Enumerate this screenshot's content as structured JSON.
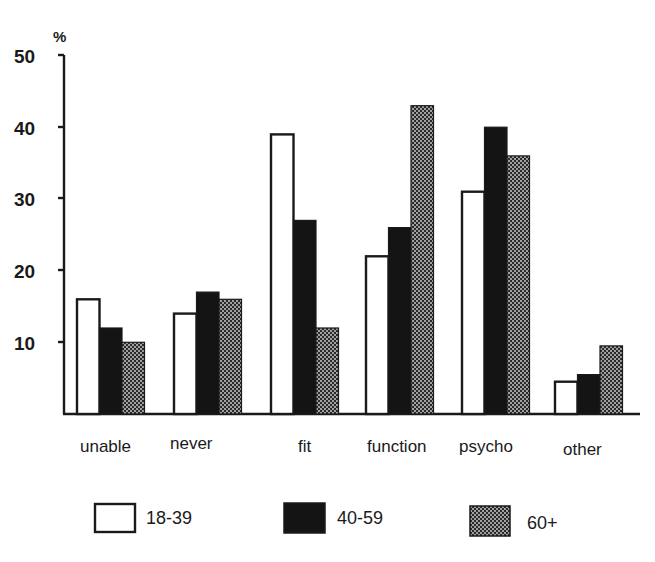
{
  "chart_data": {
    "type": "bar",
    "title": "",
    "xlabel": "",
    "ylabel": "%",
    "ylim": [
      0,
      50
    ],
    "yticks": [
      10,
      20,
      30,
      40,
      50
    ],
    "grid": false,
    "legend_position": "bottom",
    "categories": [
      "unable",
      "never",
      "fit",
      "function",
      "psycho",
      "other"
    ],
    "series": [
      {
        "name": "18-39",
        "fill": "white",
        "values": [
          16,
          14,
          39,
          22,
          31,
          4.5
        ]
      },
      {
        "name": "40-59",
        "fill": "black",
        "values": [
          12,
          17,
          27,
          26,
          40,
          5.5
        ]
      },
      {
        "name": "60+",
        "fill": "dotted-gray",
        "values": [
          10,
          16,
          12,
          43,
          36,
          9.5
        ]
      }
    ]
  },
  "axis": {
    "unit": "%",
    "tick_labels": [
      "10",
      "20",
      "30",
      "40",
      "50"
    ]
  },
  "colors": {
    "outline": "#1a1a1a",
    "black_fill": "#141414",
    "dot_bg": "#2a2a2a",
    "dot_fg": "#d8d8d8",
    "background": "#ffffff"
  }
}
